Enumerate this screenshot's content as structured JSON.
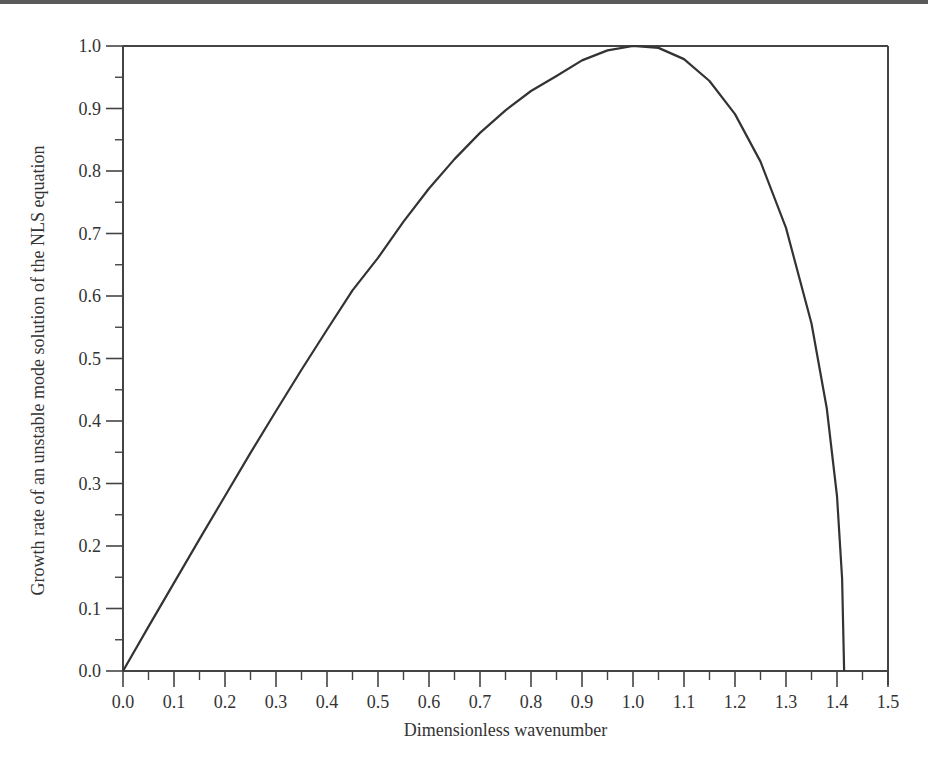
{
  "chart_data": {
    "type": "line",
    "title": "",
    "xlabel": "Dimensionless wavenumber",
    "ylabel": "Growth rate of an unstable mode solution of the NLS equation",
    "xlim": [
      0.0,
      1.5
    ],
    "ylim": [
      0.0,
      1.0
    ],
    "grid": false,
    "legend": null,
    "x_ticks": [
      "0.0",
      "0.1",
      "0.2",
      "0.3",
      "0.4",
      "0.5",
      "0.6",
      "0.7",
      "0.8",
      "0.9",
      "1.0",
      "1.1",
      "1.2",
      "1.3",
      "1.4",
      "1.5"
    ],
    "y_ticks": [
      "0.0",
      "0.1",
      "0.2",
      "0.3",
      "0.4",
      "0.5",
      "0.6",
      "0.7",
      "0.8",
      "0.9",
      "1.0"
    ],
    "series": [
      {
        "name": "growth rate",
        "color": "#333333",
        "x": [
          0.0,
          0.05,
          0.1,
          0.15,
          0.2,
          0.25,
          0.3,
          0.35,
          0.4,
          0.45,
          0.5,
          0.55,
          0.6,
          0.65,
          0.7,
          0.75,
          0.8,
          0.85,
          0.9,
          0.95,
          1.0,
          1.05,
          1.1,
          1.15,
          1.2,
          1.25,
          1.3,
          1.35,
          1.38,
          1.4,
          1.41,
          1.414
        ],
        "y": [
          0.0,
          0.071,
          0.141,
          0.211,
          0.28,
          0.349,
          0.416,
          0.482,
          0.546,
          0.609,
          0.661,
          0.719,
          0.772,
          0.819,
          0.861,
          0.897,
          0.928,
          0.952,
          0.977,
          0.993,
          1.0,
          0.997,
          0.979,
          0.944,
          0.891,
          0.815,
          0.709,
          0.556,
          0.42,
          0.28,
          0.148,
          0.0
        ]
      }
    ]
  }
}
